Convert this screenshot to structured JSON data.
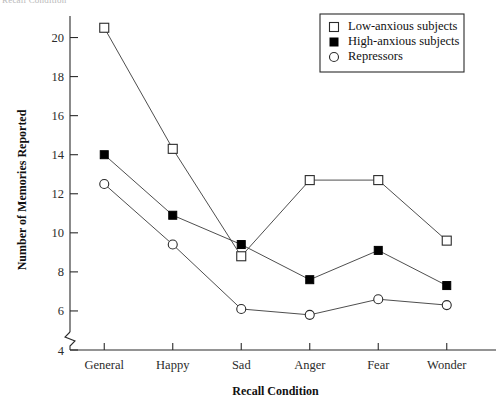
{
  "page": {
    "cut_header_text": "Recall Condition"
  },
  "chart_data": {
    "type": "line",
    "title": "",
    "xlabel": "Recall Condition",
    "ylabel": "Number of Memories Reported",
    "categories": [
      "General",
      "Happy",
      "Sad",
      "Anger",
      "Fear",
      "Wonder"
    ],
    "ylim": [
      4,
      21
    ],
    "yticks": [
      4,
      6,
      8,
      10,
      12,
      14,
      16,
      18,
      20
    ],
    "ytick_labels": [
      "4",
      "6",
      "8",
      "10",
      "12",
      "14",
      "16",
      "18",
      "20"
    ],
    "grid": false,
    "axis_break": true,
    "legend_position": "top-right",
    "series": [
      {
        "name": "Low-anxious subjects",
        "marker": "open-square",
        "values": [
          20.5,
          14.3,
          8.8,
          12.7,
          12.7,
          9.6
        ]
      },
      {
        "name": "High-anxious subjects",
        "marker": "filled-square",
        "values": [
          14.0,
          10.9,
          9.4,
          7.6,
          9.1,
          7.3
        ]
      },
      {
        "name": "Repressors",
        "marker": "open-circle",
        "values": [
          12.5,
          9.4,
          6.1,
          5.8,
          6.6,
          6.3
        ]
      }
    ]
  },
  "legend": {
    "items": [
      {
        "label": "Low-anxious subjects",
        "marker": "open-square"
      },
      {
        "label": "High-anxious subjects",
        "marker": "filled-square"
      },
      {
        "label": "Repressors",
        "marker": "open-circle"
      }
    ]
  }
}
